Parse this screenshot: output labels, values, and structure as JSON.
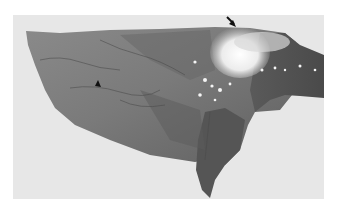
{
  "image": {
    "description": "Grayscale gross specimen photograph of an organ lobe on a light gray background",
    "background_color": "#e7e7e7",
    "tissue_color": "#6e6e6e",
    "lesion_color": "#f4f4f4",
    "annotations": [
      {
        "type": "arrow",
        "name": "arrow-marker",
        "points_to": "pale lesion at top edge",
        "x": 234,
        "y": 24
      },
      {
        "type": "arrowhead",
        "name": "arrowhead-marker",
        "points_to": "dark vessel line on surface",
        "x": 98,
        "y": 84
      }
    ]
  }
}
